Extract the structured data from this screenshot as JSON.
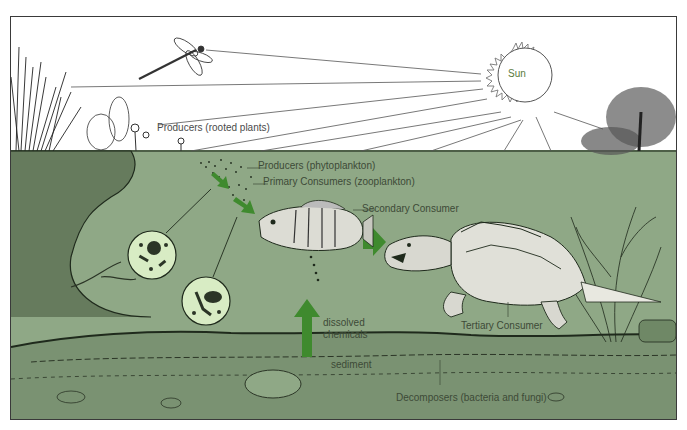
{
  "diagram": {
    "colors": {
      "water": "#8fa886",
      "sediment": "#7a9272",
      "arrow": "#3f8a2e",
      "ink": "#1f2a1c",
      "microscope_circle": "#d8ecc4"
    },
    "labels": {
      "sun": "Sun",
      "producers_rooted": "Producers (rooted plants)",
      "producers_phyto": "Producers (phytoplankton)",
      "primary_consumers": "Primary Consumers (zooplankton)",
      "secondary_consumer": "Secondary Consumer",
      "tertiary_consumer": "Tertiary Consumer",
      "dissolved_chemicals_1": "dissolved",
      "dissolved_chemicals_2": "chemicals",
      "sediment": "sediment",
      "decomposers": "Decomposers (bacteria and fungi)"
    },
    "elements": [
      {
        "name": "sun",
        "icon": "sun-icon"
      },
      {
        "name": "dragonfly",
        "icon": "dragonfly-icon"
      },
      {
        "name": "rooted plants",
        "icon": "plant-icon"
      },
      {
        "name": "phytoplankton",
        "icon": "phytoplankton-icon"
      },
      {
        "name": "zooplankton",
        "icon": "zooplankton-icon"
      },
      {
        "name": "fish (bluegill)",
        "icon": "fish-icon"
      },
      {
        "name": "snapping turtle",
        "icon": "turtle-icon"
      },
      {
        "name": "aquatic plant",
        "icon": "waterweed-icon"
      },
      {
        "name": "tree",
        "icon": "tree-icon"
      }
    ],
    "arrows": [
      {
        "from": "phytoplankton",
        "to": "zooplankton"
      },
      {
        "from": "zooplankton",
        "to": "fish"
      },
      {
        "from": "fish",
        "to": "turtle"
      },
      {
        "from": "sediment",
        "to": "water",
        "label": "dissolved chemicals"
      }
    ]
  }
}
